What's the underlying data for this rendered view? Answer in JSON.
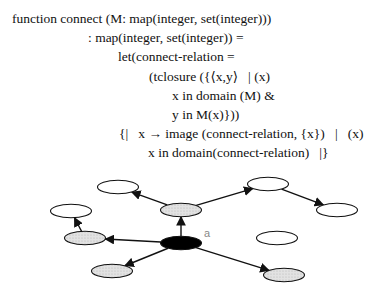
{
  "code": {
    "lines": [
      {
        "text": "function connect (M: map(integer, set(integer)))",
        "x": 12,
        "y": 11
      },
      {
        "text": ": map(integer, set(integer)) =",
        "x": 88,
        "y": 30
      },
      {
        "text": "let(connect-relation =",
        "x": 118,
        "y": 49
      },
      {
        "text": "(tclosure ({⟨x,y⟩   | (x)",
        "x": 149,
        "y": 69
      },
      {
        "text": "x in domain (M) &",
        "x": 172,
        "y": 88
      },
      {
        "text": "y in M(x)}))",
        "x": 172,
        "y": 107
      },
      {
        "text": "{|   x → image (connect-relation, {x})   |   (x)",
        "x": 119,
        "y": 126
      },
      {
        "text": "x in domain(connect-relation)   |}",
        "x": 148,
        "y": 145
      }
    ]
  },
  "graph": {
    "colors": {
      "white": "#ffffff",
      "gray": "#d9d9d9",
      "black": "#000000",
      "stroke": "#111111"
    },
    "nodes": [
      {
        "id": "top-left",
        "cx": 118,
        "cy": 187,
        "fill": "white"
      },
      {
        "id": "top-center",
        "cx": 181,
        "cy": 210,
        "fill": "gray"
      },
      {
        "id": "top-right",
        "cx": 268,
        "cy": 184,
        "fill": "white"
      },
      {
        "id": "far-right",
        "cx": 337,
        "cy": 210,
        "fill": "white"
      },
      {
        "id": "left-upper",
        "cx": 71,
        "cy": 211,
        "fill": "white"
      },
      {
        "id": "left-lower",
        "cx": 85,
        "cy": 238,
        "fill": "gray"
      },
      {
        "id": "a",
        "cx": 181,
        "cy": 243,
        "fill": "black"
      },
      {
        "id": "mid-right",
        "cx": 277,
        "cy": 238,
        "fill": "white"
      },
      {
        "id": "bottom-left",
        "cx": 112,
        "cy": 271,
        "fill": "gray"
      },
      {
        "id": "bottom-right",
        "cx": 284,
        "cy": 275,
        "fill": "gray"
      }
    ],
    "label": {
      "text": "a",
      "x": 204,
      "y": 237
    },
    "edges": [
      {
        "from": "a",
        "to": "top-center"
      },
      {
        "from": "a",
        "to": "left-lower"
      },
      {
        "from": "a",
        "to": "bottom-left"
      },
      {
        "from": "a",
        "to": "bottom-right"
      },
      {
        "from": "top-center",
        "to": "top-left"
      },
      {
        "from": "top-center",
        "to": "top-right"
      },
      {
        "from": "top-right",
        "to": "far-right"
      },
      {
        "from": "left-lower",
        "to": "left-upper"
      }
    ]
  }
}
